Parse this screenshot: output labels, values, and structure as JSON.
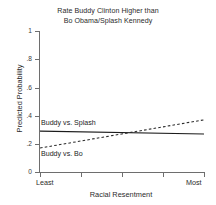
{
  "chart_data": {
    "type": "line",
    "title": "Rate Buddy Clinton Higher than Bo Obama/Splash Kennedy",
    "title_lines": [
      "Rate Buddy Clinton Higher than",
      "Bo Obama/Splash Kennedy"
    ],
    "xlabel": "Racial Resentment",
    "ylabel": "Predicted Probability",
    "ylim": [
      0,
      1
    ],
    "xlim": [
      0,
      1
    ],
    "grid": false,
    "legend_position": "inline-annotation",
    "ytick_labels": [
      "1",
      ".8",
      ".6",
      ".4",
      ".2",
      "0"
    ],
    "ytick_values": [
      1,
      0.8,
      0.6,
      0.4,
      0.2,
      0
    ],
    "xtick_labels": [
      "Least",
      "",
      "",
      "",
      "Most"
    ],
    "xtick_values": [
      0,
      0.25,
      0.5,
      0.75,
      1
    ],
    "x": [
      0,
      1
    ],
    "series": [
      {
        "name": "Buddy vs. Splash",
        "style": "solid",
        "color": "#1c1c1c",
        "values": [
          0.29,
          0.27
        ],
        "annotation": "Buddy vs. Splash"
      },
      {
        "name": "Buddy vs. Bo",
        "style": "dashed",
        "color": "#2a2a2a",
        "values": [
          0.17,
          0.37
        ],
        "annotation": "Buddy vs. Bo"
      }
    ],
    "crossing_point_x": 0.58
  },
  "colors": {
    "background": "#ffffff",
    "axis": "#6e6e6e",
    "text": "#2b2b2b",
    "series_solid": "#1c1c1c",
    "series_dashed": "#2a2a2a"
  }
}
